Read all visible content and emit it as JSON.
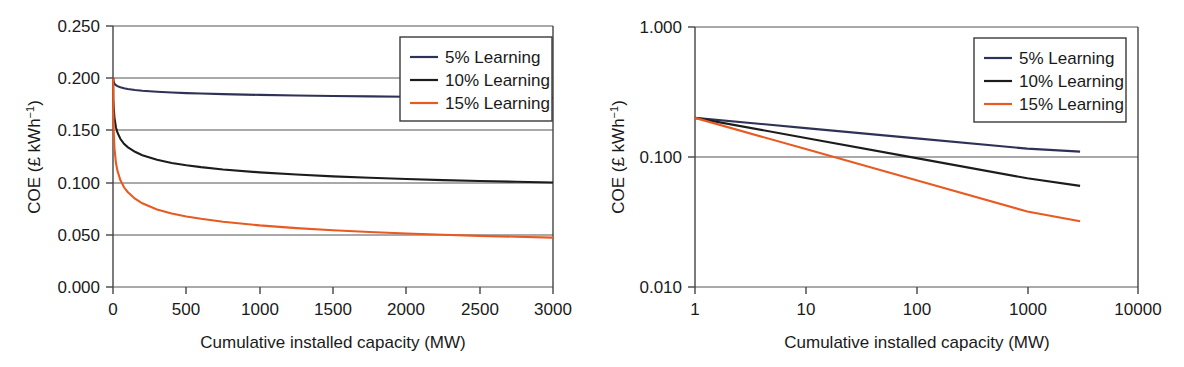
{
  "figure": {
    "panels": [
      {
        "id": "linear-panel",
        "axis": {
          "xlabel": "Cumulative installed capacity (MW)",
          "ylabel_main": "COE (£ kWh",
          "ylabel_sup": "−1",
          "ylabel_tail": ")",
          "xticks": [
            "0",
            "500",
            "1000",
            "1500",
            "2000",
            "2500",
            "3000"
          ],
          "yticks": [
            "0.250",
            "0.200",
            "0.150",
            "0.100",
            "0.050",
            "0.000"
          ]
        },
        "legend": {
          "items": [
            {
              "label": "5% Learning",
              "color": "#2e3257"
            },
            {
              "label": "10% Learning",
              "color": "#1c1c1c"
            },
            {
              "label": "15% Learning",
              "color": "#e85a22"
            }
          ]
        }
      },
      {
        "id": "log-panel",
        "axis": {
          "xlabel": "Cumulative installed capacity (MW)",
          "ylabel_main": "COE (£ kWh",
          "ylabel_sup": "−1",
          "ylabel_tail": ")",
          "xticks": [
            "1",
            "10",
            "100",
            "1000",
            "10000"
          ],
          "yticks": [
            "1.000",
            "0.100",
            "0.010"
          ]
        },
        "legend": {
          "items": [
            {
              "label": "5% Learning",
              "color": "#2e3257"
            },
            {
              "label": "10% Learning",
              "color": "#1c1c1c"
            },
            {
              "label": "15% Learning",
              "color": "#e85a22"
            }
          ]
        }
      }
    ]
  },
  "chart_data": [
    {
      "type": "line",
      "title": "",
      "xlabel": "Cumulative installed capacity (MW)",
      "ylabel": "COE (£ kWh⁻¹)",
      "xscale": "linear",
      "yscale": "linear",
      "xlim": [
        0,
        3000
      ],
      "ylim": [
        0.0,
        0.25
      ],
      "xticks": [
        0,
        500,
        1000,
        1500,
        2000,
        2500,
        3000
      ],
      "yticks": [
        0.0,
        0.05,
        0.1,
        0.15,
        0.2,
        0.25
      ],
      "grid": "horizontal",
      "legend_position": "top-right",
      "x": [
        1,
        2,
        5,
        10,
        20,
        30,
        50,
        75,
        100,
        150,
        200,
        300,
        400,
        500,
        600,
        750,
        1000,
        1250,
        1500,
        1750,
        2000,
        2250,
        2500,
        2750,
        3000
      ],
      "series": [
        {
          "name": "5% Learning",
          "color": "#2e3257",
          "values": [
            0.2,
            0.1985,
            0.1963,
            0.1948,
            0.1933,
            0.1924,
            0.1913,
            0.1904,
            0.1897,
            0.1887,
            0.188,
            0.187,
            0.1863,
            0.1857,
            0.1853,
            0.1847,
            0.184,
            0.1835,
            0.183,
            0.1826,
            0.1823,
            0.182,
            0.1817,
            0.1815,
            0.1813
          ]
        },
        {
          "name": "10% Learning",
          "color": "#1c1c1c",
          "values": [
            0.2,
            0.18,
            0.1716,
            0.162,
            0.153,
            0.148,
            0.142,
            0.1372,
            0.134,
            0.1295,
            0.1262,
            0.1218,
            0.1188,
            0.1166,
            0.1148,
            0.1126,
            0.1098,
            0.1077,
            0.106,
            0.1046,
            0.1034,
            0.1024,
            0.1015,
            0.1008,
            0.1001
          ]
        },
        {
          "name": "15% Learning",
          "color": "#e85a22",
          "values": [
            0.2,
            0.17,
            0.148,
            0.133,
            0.119,
            0.1115,
            0.1025,
            0.0955,
            0.091,
            0.0846,
            0.0802,
            0.0743,
            0.0704,
            0.0675,
            0.0653,
            0.0625,
            0.059,
            0.0564,
            0.0543,
            0.0527,
            0.0513,
            0.0501,
            0.049,
            0.0481,
            0.0473
          ]
        }
      ],
      "note_curve_rendering": "Plotted curves are learning curves COE = 0.200 * (capacity)^(log2(1-r)) anchored at 0.200 at 1 MW; visual endpoints at 3000 MW are approximately 0.110 (5%), 0.060 (10%) and 0.032 (15%)."
    },
    {
      "type": "line",
      "title": "",
      "xlabel": "Cumulative installed capacity (MW)",
      "ylabel": "COE (£ kWh⁻¹)",
      "xscale": "log",
      "yscale": "log",
      "xlim": [
        1,
        10000
      ],
      "ylim": [
        0.01,
        1.0
      ],
      "xticks": [
        1,
        10,
        100,
        1000,
        10000
      ],
      "yticks": [
        0.01,
        0.1,
        1.0
      ],
      "grid": "horizontal",
      "legend_position": "top-right",
      "x": [
        1,
        10,
        100,
        1000,
        3000
      ],
      "series": [
        {
          "name": "5% Learning",
          "color": "#2e3257",
          "values": [
            0.2,
            0.1668,
            0.1391,
            0.116,
            0.11
          ]
        },
        {
          "name": "10% Learning",
          "color": "#1c1c1c",
          "values": [
            0.2,
            0.14,
            0.098,
            0.0686,
            0.06
          ]
        },
        {
          "name": "15% Learning",
          "color": "#e85a22",
          "values": [
            0.2,
            0.1151,
            0.0663,
            0.0381,
            0.032
          ]
        }
      ]
    }
  ]
}
